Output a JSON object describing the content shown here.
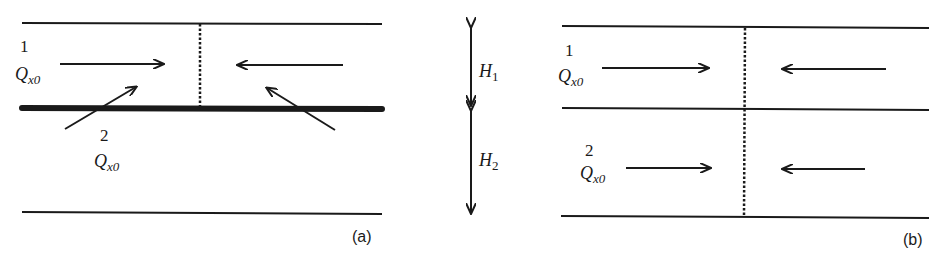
{
  "figure": {
    "panel_a": {
      "caption": "(a)",
      "layer_top_label": "1",
      "layer_top_flux": "Q",
      "layer_top_flux_sub": "x0",
      "layer_bottom_label": "2",
      "layer_bottom_flux": "Q",
      "layer_bottom_flux_sub": "x0"
    },
    "thickness": {
      "h1_symbol": "H",
      "h1_sub": "1",
      "h2_symbol": "H",
      "h2_sub": "2"
    },
    "panel_b": {
      "caption": "(b)",
      "layer_top_label": "1",
      "layer_top_flux": "Q",
      "layer_top_flux_sub": "x0",
      "layer_bottom_label": "2",
      "layer_bottom_flux": "Q",
      "layer_bottom_flux_sub": "x0"
    },
    "colors": {
      "ink": "#1a1a1a",
      "background": "#ffffff"
    }
  }
}
